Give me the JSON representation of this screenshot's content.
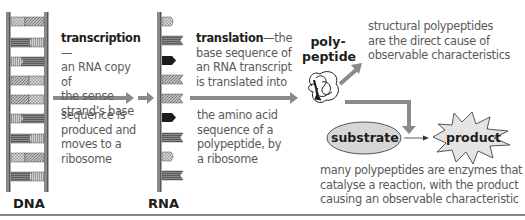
{
  "diagram": {
    "dna": {
      "label": "DNA"
    },
    "rna": {
      "label": "RNA"
    },
    "transcription": {
      "term": "transcription",
      "dash": "—",
      "line1": "an RNA copy of",
      "line2": "the sense",
      "line3": "strand’s base",
      "line4": "sequence is",
      "line5": "produced and",
      "line6": "moves to a",
      "line7": "ribosome"
    },
    "translation": {
      "term": "translation",
      "dash": "—the",
      "line1": "base sequence of",
      "line2": "an RNA transcript",
      "line3": "is translated into",
      "line4": "the amino acid",
      "line5": "sequence of a",
      "line6": "polypeptide, by",
      "line7": "a ribosome"
    },
    "polypeptide": {
      "line1": "poly-",
      "line2": "peptide"
    },
    "structural": {
      "line1": "structural polypeptides",
      "line2": "are the direct cause of",
      "line3": "observable characteristics"
    },
    "substrate": {
      "label": "substrate"
    },
    "product": {
      "label": "product"
    },
    "enzymes": {
      "line1": "many polypeptides are enzymes that",
      "line2": "catalyse a reaction, with the product",
      "line3": "causing an observable characteristic"
    },
    "colors": {
      "arrow": "#8a8a8a",
      "ellipse_fill": "#d6d6d6",
      "star_fill": "#e4e4e4",
      "text": "#5a5a5a",
      "label": "#1c1c1c"
    }
  }
}
